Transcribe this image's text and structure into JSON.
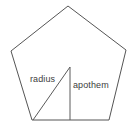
{
  "figure": {
    "type": "geometry-diagram",
    "shape_name": "regular pentagon",
    "background_color": "#ffffff",
    "outline_color": "#555555",
    "segment_color": "#5a5a5a",
    "label_color": "#3d3d3d",
    "width": 136,
    "height": 133
  },
  "polygon": {
    "sides": 5,
    "name": "pentagon",
    "vertices": [
      {
        "name": "top-apex",
        "x": 68,
        "y": 6
      },
      {
        "name": "right-upper",
        "x": 126,
        "y": 50
      },
      {
        "name": "bottom-right",
        "x": 109,
        "y": 120
      },
      {
        "name": "bottom-left",
        "x": 32,
        "y": 120
      },
      {
        "name": "left-upper",
        "x": 11,
        "y": 51
      }
    ],
    "points_attr": "68,6 126,50 109,120 32,120 11,51"
  },
  "center": {
    "name": "center",
    "x": 70,
    "y": 67
  },
  "segments": [
    {
      "name": "radius",
      "label": "radius",
      "from": {
        "x": 70,
        "y": 67
      },
      "to": {
        "x": 33,
        "y": 120
      },
      "description": "line from center to a vertex"
    },
    {
      "name": "apothem",
      "label": "apothem",
      "from": {
        "x": 70,
        "y": 67
      },
      "to": {
        "x": 70,
        "y": 120
      },
      "description": "perpendicular line from center to midpoint of a side"
    }
  ],
  "labels": {
    "radius": "radius",
    "apothem": "apothem"
  }
}
